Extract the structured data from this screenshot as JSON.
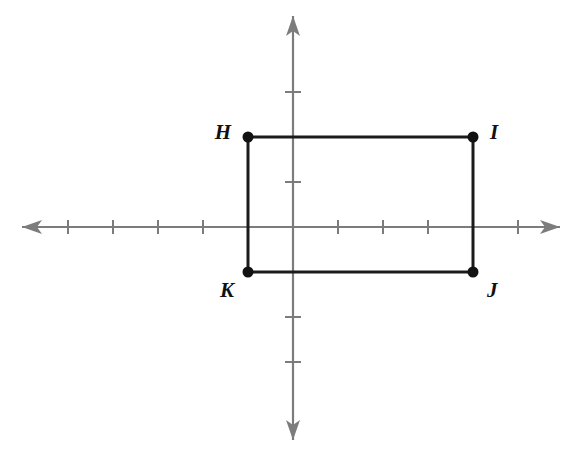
{
  "figure": {
    "background_color": "#ffffff",
    "axis_color": "#7c7c7c",
    "shape_color": "#1b1b1b",
    "label_color": "#111111"
  },
  "chart_data": {
    "type": "scatter",
    "xlabel": "",
    "ylabel": "",
    "xlim": [
      -6,
      6
    ],
    "ylim": [
      -5,
      5
    ],
    "grid": false,
    "legend": "none",
    "tick_step": 1,
    "x_ticks": [
      -5,
      -4,
      -3,
      -2,
      -1,
      1,
      2,
      3,
      4,
      5
    ],
    "y_ticks": [
      -3,
      -2,
      1,
      2,
      3
    ],
    "shape": "rectangle",
    "shape_name": "HIJK",
    "width_units": 5,
    "height_units": 3,
    "points": [
      {
        "label": "H",
        "x": -1,
        "y": 2,
        "label_position": "left"
      },
      {
        "label": "I",
        "x": 4,
        "y": 2,
        "label_position": "right"
      },
      {
        "label": "J",
        "x": 4,
        "y": -1,
        "label_position": "below-right"
      },
      {
        "label": "K",
        "x": -1,
        "y": -1,
        "label_position": "below-left"
      }
    ],
    "edges": [
      [
        "H",
        "I"
      ],
      [
        "I",
        "J"
      ],
      [
        "J",
        "K"
      ],
      [
        "K",
        "H"
      ]
    ]
  },
  "geometry": {
    "origin": {
      "x": 293,
      "y": 227
    },
    "unit_px": 45,
    "x_axis": {
      "start_x": 22,
      "end_x": 560
    },
    "y_axis": {
      "start_y": 16,
      "end_y": 440
    },
    "tick_half_len_x": 7,
    "tick_half_len_y": 8,
    "dot_radius": 5.5
  },
  "labels": {
    "h": "H",
    "i": "I",
    "j": "J",
    "k": "K"
  }
}
